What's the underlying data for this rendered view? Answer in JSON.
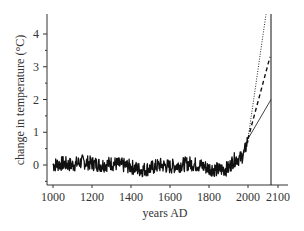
{
  "chart_data": {
    "type": "line",
    "title": "",
    "xlabel": "years AD",
    "ylabel": "change in temperature (°C)",
    "xlim": [
      990,
      2110
    ],
    "ylim": [
      -0.6,
      4.6
    ],
    "x_ticks": [
      1000,
      1200,
      1400,
      1600,
      1800,
      2000,
      2100
    ],
    "x_tick_labels": [
      "1000",
      "1200",
      "1400",
      "1600",
      "1800",
      "2000",
      "2100"
    ],
    "y_ticks": [
      0,
      1,
      2,
      3,
      4
    ],
    "y_tick_labels": [
      "0",
      "1",
      "2",
      "3",
      "4"
    ],
    "y_minor_ticks": [
      -0.5,
      0.5,
      1.5,
      2.5,
      3.5
    ],
    "grid": false,
    "legend": null,
    "series": [
      {
        "name": "reconstructed temperature",
        "style": "solid-thick-noisy",
        "x": [
          1000,
          1050,
          1100,
          1150,
          1200,
          1250,
          1300,
          1350,
          1400,
          1450,
          1500,
          1550,
          1600,
          1650,
          1700,
          1750,
          1800,
          1850,
          1900,
          1920,
          1940,
          1960,
          1980,
          2000
        ],
        "values": [
          0.0,
          0.05,
          0.0,
          0.1,
          0.05,
          0.0,
          0.05,
          0.0,
          -0.05,
          -0.15,
          -0.1,
          0.0,
          -0.05,
          0.0,
          0.05,
          0.0,
          -0.1,
          -0.15,
          -0.1,
          0.1,
          0.2,
          0.2,
          0.35,
          0.8
        ]
      },
      {
        "name": "projection high",
        "style": "dotted",
        "x": [
          2000,
          2090
        ],
        "values": [
          0.8,
          4.6
        ]
      },
      {
        "name": "projection mid",
        "style": "dashed",
        "x": [
          2000,
          2100
        ],
        "values": [
          0.8,
          3.3
        ]
      },
      {
        "name": "projection low",
        "style": "solid-thin",
        "x": [
          2000,
          2100
        ],
        "values": [
          0.8,
          2.0
        ]
      }
    ],
    "annotations": [
      {
        "type": "vertical-line",
        "x": 2100,
        "style": "solid-thin"
      }
    ]
  },
  "colors": {
    "line": "#111111",
    "axis": "#333333",
    "text": "#333333"
  }
}
